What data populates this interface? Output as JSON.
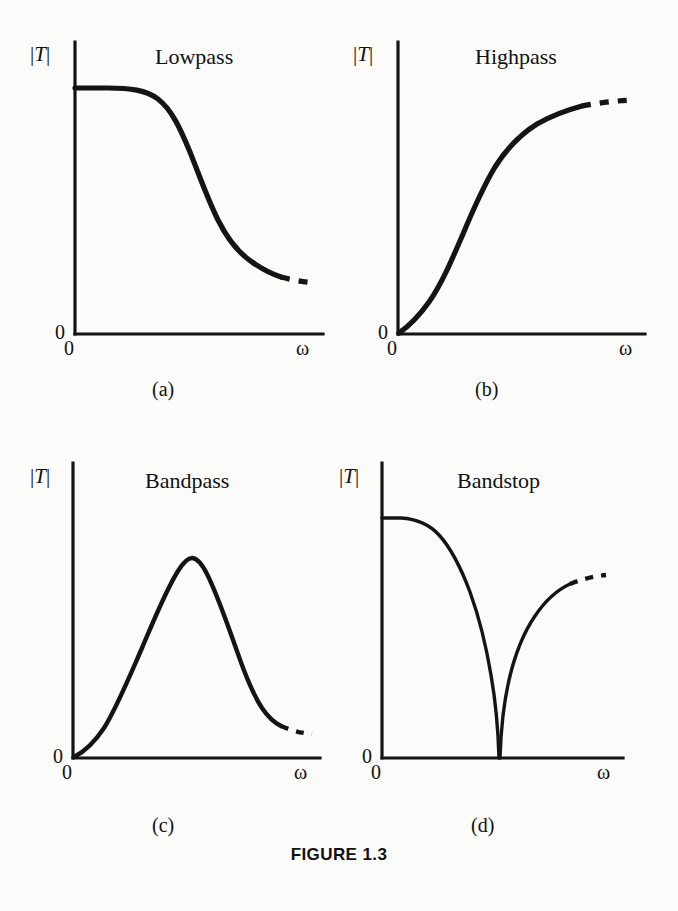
{
  "figure": {
    "caption": "FIGURE 1.3",
    "background_color": "#fbfbfa",
    "ink_color": "#141414"
  },
  "axis_labels": {
    "y_symbol_open": "|",
    "y_symbol_letter": "T",
    "y_symbol_close": "|",
    "y_origin": "0",
    "x_origin": "0",
    "x_symbol": "ω"
  },
  "panels": [
    {
      "id": "a",
      "title": "Lowpass",
      "subcaption": "(a)",
      "y_label": "|T|",
      "y_zero": "0",
      "x_zero": "0",
      "x_label": "ω"
    },
    {
      "id": "b",
      "title": "Highpass",
      "subcaption": "(b)",
      "y_label": "|T|",
      "y_zero": "0",
      "x_zero": "0",
      "x_label": "ω"
    },
    {
      "id": "c",
      "title": "Bandpass",
      "subcaption": "(c)",
      "y_label": "|T|",
      "y_zero": "0",
      "x_zero": "0",
      "x_label": "ω"
    },
    {
      "id": "d",
      "title": "Bandstop",
      "subcaption": "(d)",
      "y_label": "|T|",
      "y_zero": "0",
      "x_zero": "0",
      "x_label": "ω"
    }
  ],
  "chart_data": [
    {
      "type": "line",
      "title": "Lowpass",
      "subcaption": "(a)",
      "xlabel": "ω",
      "ylabel": "|T|",
      "xlim": [
        0,
        1
      ],
      "ylim": [
        0,
        1
      ],
      "grid": false,
      "legend": "none",
      "xticks": [
        "0"
      ],
      "yticks": [
        "0"
      ],
      "annotations": [
        "dashed continuation at high frequency"
      ],
      "x": [
        0.0,
        0.05,
        0.1,
        0.15,
        0.2,
        0.25,
        0.3,
        0.35,
        0.4,
        0.45,
        0.5,
        0.55,
        0.6,
        0.65,
        0.7,
        0.75,
        0.8,
        0.85,
        0.9,
        0.95,
        1.0
      ],
      "y": [
        1.0,
        1.0,
        1.0,
        0.995,
        0.985,
        0.965,
        0.93,
        0.875,
        0.8,
        0.705,
        0.6,
        0.5,
        0.41,
        0.335,
        0.28,
        0.24,
        0.21,
        0.19,
        0.178,
        0.17,
        0.165
      ],
      "dashed_from_x": 0.84
    },
    {
      "type": "line",
      "title": "Highpass",
      "subcaption": "(b)",
      "xlabel": "ω",
      "ylabel": "|T|",
      "xlim": [
        0,
        1
      ],
      "ylim": [
        0,
        1
      ],
      "grid": false,
      "legend": "none",
      "xticks": [
        "0"
      ],
      "yticks": [
        "0"
      ],
      "annotations": [
        "dashed continuation at high frequency"
      ],
      "x": [
        0.0,
        0.05,
        0.1,
        0.15,
        0.2,
        0.25,
        0.3,
        0.35,
        0.4,
        0.45,
        0.5,
        0.55,
        0.6,
        0.65,
        0.7,
        0.75,
        0.8,
        0.85,
        0.9,
        0.95,
        1.0
      ],
      "y": [
        0.0,
        0.035,
        0.085,
        0.15,
        0.235,
        0.34,
        0.455,
        0.575,
        0.68,
        0.77,
        0.84,
        0.89,
        0.925,
        0.948,
        0.963,
        0.973,
        0.98,
        0.985,
        0.988,
        0.99,
        0.992
      ],
      "dashed_from_x": 0.8
    },
    {
      "type": "line",
      "title": "Bandpass",
      "subcaption": "(c)",
      "xlabel": "ω",
      "ylabel": "|T|",
      "xlim": [
        0,
        1
      ],
      "ylim": [
        0,
        1
      ],
      "grid": false,
      "legend": "none",
      "xticks": [
        "0"
      ],
      "yticks": [
        "0"
      ],
      "annotations": [
        "peak near ω = 0.33",
        "dashed continuation at high frequency"
      ],
      "x": [
        0.0,
        0.05,
        0.1,
        0.15,
        0.2,
        0.25,
        0.3,
        0.33,
        0.36,
        0.4,
        0.45,
        0.5,
        0.55,
        0.6,
        0.65,
        0.7,
        0.75,
        0.8,
        0.85,
        0.9,
        0.95,
        1.0
      ],
      "y": [
        0.0,
        0.045,
        0.135,
        0.29,
        0.5,
        0.73,
        0.93,
        0.985,
        0.975,
        0.92,
        0.81,
        0.67,
        0.52,
        0.38,
        0.265,
        0.18,
        0.125,
        0.09,
        0.07,
        0.058,
        0.05,
        0.046
      ],
      "dashed_from_x": 0.83
    },
    {
      "type": "line",
      "title": "Bandstop",
      "subcaption": "(d)",
      "xlabel": "ω",
      "ylabel": "|T|",
      "xlim": [
        0,
        1
      ],
      "ylim": [
        0,
        1
      ],
      "grid": false,
      "legend": "none",
      "xticks": [
        "0"
      ],
      "yticks": [
        "0"
      ],
      "annotations": [
        "notch to zero near ω = 0.44",
        "dashed continuation at high frequency"
      ],
      "x": [
        0.0,
        0.05,
        0.1,
        0.15,
        0.2,
        0.25,
        0.3,
        0.35,
        0.4,
        0.43,
        0.44,
        0.45,
        0.48,
        0.52,
        0.56,
        0.62,
        0.68,
        0.74,
        0.8,
        0.86,
        0.92,
        1.0
      ],
      "y": [
        0.93,
        0.925,
        0.905,
        0.87,
        0.815,
        0.74,
        0.64,
        0.51,
        0.33,
        0.13,
        0.0,
        0.14,
        0.4,
        0.6,
        0.72,
        0.815,
        0.87,
        0.9,
        0.918,
        0.928,
        0.932,
        0.935
      ],
      "dashed_from_x": 0.855
    }
  ]
}
